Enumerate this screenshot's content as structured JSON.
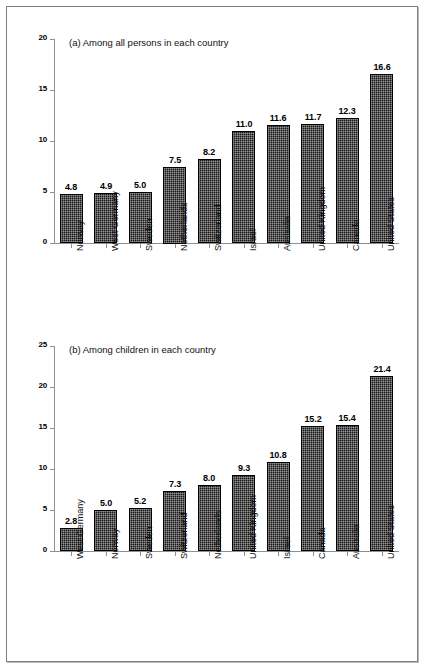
{
  "figure": {
    "background_color": "#ffffff",
    "frame_color": "#7b7f86",
    "bar_color": "#171717",
    "axis_color": "#8d9097"
  },
  "chart_data": [
    {
      "type": "bar",
      "panel": "a",
      "title": "(a) Among all persons in each country",
      "xlabel": "",
      "ylabel": "",
      "ylim": [
        0,
        20
      ],
      "yticks": [
        0,
        5,
        10,
        15,
        20
      ],
      "ytick_labels": [
        "0",
        "5",
        "10",
        "15",
        "20"
      ],
      "grid": false,
      "legend": "none",
      "categories": [
        "Norway",
        "West Germany",
        "Sweden",
        "Netherlands",
        "Switzerland",
        "Israel",
        "Australia",
        "United Kingdom",
        "Canada",
        "United States"
      ],
      "values": [
        4.8,
        4.9,
        5.0,
        7.5,
        8.2,
        11.0,
        11.6,
        11.7,
        12.3,
        16.6
      ],
      "value_labels": [
        "4.8",
        "4.9",
        "5.0",
        "7.5",
        "8.2",
        "11.0",
        "11.6",
        "11.7",
        "12.3",
        "16.6"
      ]
    },
    {
      "type": "bar",
      "panel": "b",
      "title": "(b) Among children in each country",
      "xlabel": "",
      "ylabel": "",
      "ylim": [
        0,
        25
      ],
      "yticks": [
        0,
        5,
        10,
        15,
        20,
        25
      ],
      "ytick_labels": [
        "0",
        "5",
        "10",
        "15",
        "20",
        "25"
      ],
      "grid": false,
      "legend": "none",
      "categories": [
        "West Germany",
        "Norway",
        "Sweden",
        "Switzerland",
        "Netherlands",
        "United Kingdom",
        "Israel",
        "Canada",
        "Australia",
        "United States"
      ],
      "values": [
        2.8,
        5.0,
        5.2,
        7.3,
        8.0,
        9.3,
        10.8,
        15.2,
        15.4,
        21.4
      ],
      "value_labels": [
        "2.8",
        "5.0",
        "5.2",
        "7.3",
        "8.0",
        "9.3",
        "10.8",
        "15.2",
        "15.4",
        "21.4"
      ]
    }
  ]
}
